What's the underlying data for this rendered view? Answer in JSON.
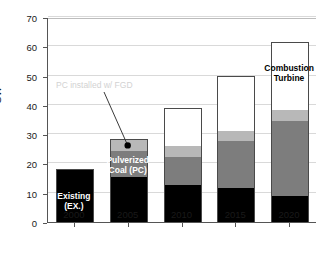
{
  "chart_data": {
    "type": "bar",
    "subtype": "stacked-bar",
    "title": "",
    "xlabel": "",
    "ylabel": "GW",
    "categories": [
      "2000",
      "2005",
      "2010",
      "2015",
      "2020"
    ],
    "ylim": [
      0,
      70
    ],
    "yticks": [
      0,
      10,
      20,
      30,
      40,
      50,
      60,
      70
    ],
    "grid": true,
    "legend": "in-chart annotations",
    "series": [
      {
        "name": "Existing (EX.)",
        "color": "#000000",
        "values": [
          18.2,
          15.4,
          12.8,
          11.8,
          8.9
        ]
      },
      {
        "name": "Pulverized Coal (PC)",
        "color": "#7d7d7d",
        "values": [
          0,
          9.1,
          9.7,
          16.1,
          25.7
        ]
      },
      {
        "name": "PC installed w/ FGD",
        "color": "#b8b8b8",
        "values": [
          0,
          4.0,
          3.8,
          3.5,
          3.9
        ]
      },
      {
        "name": "Combustion Turbine",
        "color": "#ffffff",
        "values": [
          0,
          0,
          12.7,
          18.4,
          23.0
        ]
      }
    ],
    "totals": [
      18.2,
      28.5,
      39.0,
      49.8,
      61.5
    ],
    "annotations": [
      {
        "name": "fgd-callout",
        "text": "PC installed w/ FGD",
        "color": "#d2d2d2",
        "points_to": "2005 light-gray segment"
      },
      {
        "name": "existing-label",
        "text": "Existing\n(EX.)",
        "color": "#ffffff"
      },
      {
        "name": "pc-label",
        "text": "Pulverized\nCoal (PC)",
        "color": "#ffffff"
      },
      {
        "name": "ct-label",
        "text": "Combustion\nTurbine",
        "color": "#000000"
      }
    ]
  },
  "axis": {
    "y_label": "GW",
    "y_ticks": [
      "70",
      "60",
      "50",
      "40",
      "30",
      "20",
      "10",
      "0"
    ],
    "x_ticks": [
      "2000",
      "2005",
      "2010",
      "2015",
      "2020"
    ]
  },
  "labels": {
    "existing": "Existing\n(EX.)",
    "pulverized": "Pulverized\nCoal (PC)",
    "combustion": "Combustion\nTurbine",
    "fgd_callout": "PC installed w/ FGD"
  }
}
